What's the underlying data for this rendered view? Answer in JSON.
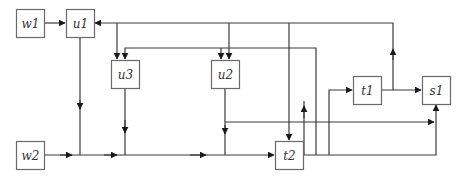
{
  "diagram": {
    "type": "block-flow",
    "colors": {
      "line": "#3a3a3a",
      "box_stroke": "#6a6a6a",
      "arrow": "#1a1a1a",
      "background": "#ffffff",
      "text": "#333333"
    },
    "nodes": [
      {
        "id": "w1",
        "label": "w1"
      },
      {
        "id": "u1",
        "label": "u1"
      },
      {
        "id": "u3",
        "label": "u3"
      },
      {
        "id": "u2",
        "label": "u2"
      },
      {
        "id": "t1",
        "label": "t1"
      },
      {
        "id": "s1",
        "label": "s1"
      },
      {
        "id": "w2",
        "label": "w2"
      },
      {
        "id": "t2",
        "label": "t2"
      }
    ],
    "edges": [
      {
        "from": "w1",
        "to": "u1"
      },
      {
        "from": "t1",
        "to": "u1"
      },
      {
        "from": "t1",
        "to": "u3"
      },
      {
        "from": "t1",
        "to": "u2"
      },
      {
        "from": "t1",
        "to": "t2"
      },
      {
        "from": "t2",
        "to": "u3"
      },
      {
        "from": "t2",
        "to": "u2"
      },
      {
        "from": "u1",
        "to": "t2"
      },
      {
        "from": "u3",
        "to": "t2"
      },
      {
        "from": "u2",
        "to": "t2"
      },
      {
        "from": "u2",
        "to": "s1"
      },
      {
        "from": "w2",
        "to": "t2"
      },
      {
        "from": "t2",
        "to": "t1"
      },
      {
        "from": "t2",
        "to": "s1"
      },
      {
        "from": "t1",
        "to": "s1"
      }
    ]
  }
}
